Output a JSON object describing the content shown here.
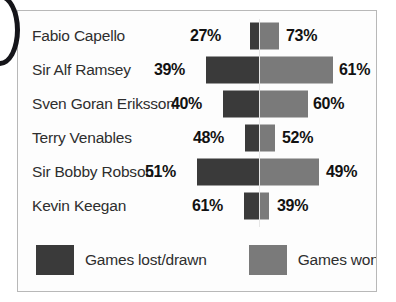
{
  "colors": {
    "lost": "#3a3a3a",
    "won": "#7a7a7a",
    "panel_border": "#b8b8b8",
    "background": "#fdfdfd",
    "text": "#2e2e2e",
    "value_text": "#121212"
  },
  "legend": {
    "lost": {
      "label": "Games lost/drawn",
      "color": "#3a3a3a"
    },
    "won": {
      "label": "Games won",
      "color": "#7a7a7a"
    }
  },
  "chart_data": {
    "type": "bar",
    "subtype": "diverging-stacked-bar",
    "title": "",
    "xlabel": "",
    "ylabel": "",
    "unit": "%",
    "categories": [
      "Fabio Capello",
      "Sir Alf Ramsey",
      "Sven Goran Eriksson",
      "Terry Venables",
      "Sir Bobby Robson",
      "Kevin Keegan"
    ],
    "series": [
      {
        "name": "Games lost/drawn",
        "color": "#3a3a3a",
        "values": [
          27,
          39,
          40,
          48,
          51,
          61
        ]
      },
      {
        "name": "Games won",
        "color": "#7a7a7a",
        "values": [
          73,
          61,
          60,
          52,
          49,
          39
        ]
      }
    ],
    "legend_position": "bottom",
    "grid": false,
    "axis_center_px": 258
  },
  "rows": [
    {
      "name": "Fabio Capello",
      "lost_label": "27%",
      "won_label": "73%",
      "lost_px": 9,
      "won_px": 20,
      "lost_value_right_px": 222,
      "won_value_left_px": 285
    },
    {
      "name": "Sir Alf Ramsey",
      "lost_label": "39%",
      "won_label": "61%",
      "lost_px": 53,
      "won_px": 74,
      "lost_value_right_px": 186,
      "won_value_left_px": 338
    },
    {
      "name": "Sven Goran Eriksson",
      "lost_label": "40%",
      "won_label": "60%",
      "lost_px": 36,
      "won_px": 49,
      "lost_value_right_px": 203,
      "won_value_left_px": 312
    },
    {
      "name": "Terry Venables",
      "lost_label": "48%",
      "won_label": "52%",
      "lost_px": 14,
      "won_px": 16,
      "lost_value_right_px": 225,
      "won_value_left_px": 281
    },
    {
      "name": "Sir Bobby Robson",
      "lost_label": "51%",
      "won_label": "49%",
      "lost_px": 62,
      "won_px": 60,
      "lost_value_right_px": 177,
      "won_value_left_px": 325
    },
    {
      "name": "Kevin Keegan",
      "lost_label": "61%",
      "won_label": "39%",
      "lost_px": 15,
      "won_px": 10,
      "lost_value_right_px": 224,
      "won_value_left_px": 276
    }
  ]
}
